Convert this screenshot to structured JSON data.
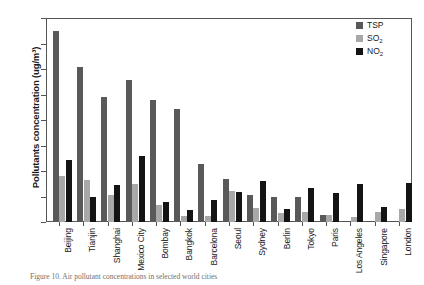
{
  "chart_data": {
    "type": "bar",
    "title": "",
    "xlabel": "",
    "ylabel": "Pollutants concentration (ug/m³)",
    "ylim": [
      0,
      400
    ],
    "yticks": [
      0,
      50,
      100,
      150,
      200,
      250,
      300,
      350,
      400
    ],
    "grid": false,
    "legend_position": "top-right",
    "categories": [
      "Beijing",
      "Tianjin",
      "Shanghai",
      "Mexico City",
      "Bombay",
      "Bangkok",
      "Barcelona",
      "Seoul",
      "Sydney",
      "Berlin",
      "Tokyo",
      "Paris",
      "Los Angeles",
      "Singapore",
      "London"
    ],
    "series": [
      {
        "name": "TSP",
        "color": "#595959",
        "values": [
          377,
          306,
          246,
          279,
          240,
          223,
          115,
          84,
          54,
          50,
          49,
          14,
          0,
          0,
          0
        ]
      },
      {
        "name": "SO2",
        "color": "#a8a8a8",
        "values": [
          90,
          82,
          53,
          74,
          33,
          11,
          11,
          62,
          28,
          18,
          19,
          14,
          9,
          20,
          25
        ]
      },
      {
        "name": "NO2",
        "color": "#141414",
        "values": [
          122,
          50,
          73,
          130,
          39,
          23,
          43,
          60,
          81,
          26,
          68,
          57,
          74,
          30,
          77
        ]
      }
    ]
  },
  "legend": {
    "items": [
      {
        "label": "TSP",
        "sub": ""
      },
      {
        "label": "SO",
        "sub": "2"
      },
      {
        "label": "NO",
        "sub": "2"
      }
    ]
  },
  "caption": {
    "text": "Figure 10.  Air pollutant concentrations in selected world cities"
  }
}
